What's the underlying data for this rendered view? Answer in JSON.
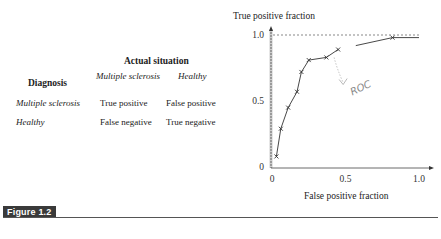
{
  "table": {
    "super_header": "Actual situation",
    "row_header": "Diagnosis",
    "col_headers": [
      "Multiple sclerosis",
      "Healthy"
    ],
    "rows": [
      {
        "label": "Multiple sclerosis",
        "cells": [
          "True positive",
          "False positive"
        ]
      },
      {
        "label": "Healthy",
        "cells": [
          "False negative",
          "True negative"
        ]
      }
    ]
  },
  "figure": {
    "label": "Figure 1.2"
  },
  "chart_data": {
    "type": "line",
    "title": "",
    "xlabel": "False positive fraction",
    "ylabel": "True positive fraction",
    "xlim": [
      0,
      1.0
    ],
    "ylim": [
      0,
      1.0
    ],
    "x_ticks": [
      "0",
      "0.5",
      "1.0"
    ],
    "y_ticks": [
      "0",
      "0.5",
      "1.0"
    ],
    "grid": false,
    "reference_line": {
      "y": 1.0,
      "style": "dashed"
    },
    "annotation": {
      "text": "ROC",
      "handwritten": true,
      "arrow_to": [
        0.45,
        0.89
      ]
    },
    "series": [
      {
        "name": "ROC curve (segment 1)",
        "marker": "x",
        "x": [
          0.03,
          0.06,
          0.11,
          0.17,
          0.2,
          0.25,
          0.37,
          0.45
        ],
        "y": [
          0.08,
          0.29,
          0.45,
          0.57,
          0.72,
          0.81,
          0.83,
          0.89
        ]
      },
      {
        "name": "ROC curve (segment 2)",
        "marker": "x",
        "x": [
          0.57,
          0.82,
          1.0
        ],
        "y": [
          0.92,
          0.98,
          0.98
        ]
      }
    ]
  }
}
